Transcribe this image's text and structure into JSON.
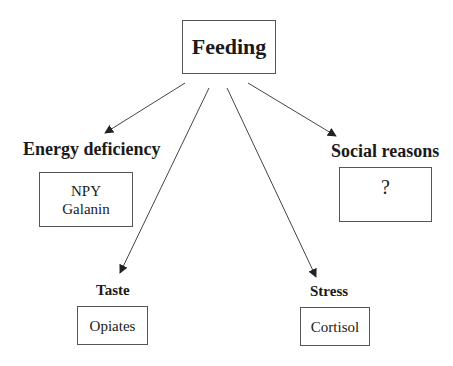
{
  "root": {
    "label": "Feeding"
  },
  "branches": [
    {
      "id": "energy",
      "label": "Energy deficiency",
      "box_lines": [
        "NPY",
        "Galanin"
      ]
    },
    {
      "id": "social",
      "label": "Social reasons",
      "box_lines": [
        "?"
      ]
    },
    {
      "id": "taste",
      "label": "Taste",
      "box_lines": [
        "Opiates"
      ]
    },
    {
      "id": "stress",
      "label": "Stress",
      "box_lines": [
        "Cortisol"
      ]
    }
  ],
  "colors": {
    "line": "#444444",
    "text": "#1a1a1a",
    "border": "#555555"
  }
}
